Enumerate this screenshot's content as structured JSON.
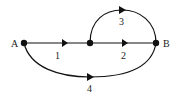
{
  "diagram": {
    "type": "directed-graph",
    "nodes": [
      {
        "id": "A",
        "label": "A",
        "x": 24,
        "y": 43
      },
      {
        "id": "M",
        "label": "",
        "x": 90,
        "y": 43
      },
      {
        "id": "B",
        "label": "B",
        "x": 156,
        "y": 43
      }
    ],
    "edges": [
      {
        "id": "1",
        "label": "1",
        "from": "A",
        "to": "M",
        "shape": "straight"
      },
      {
        "id": "2",
        "label": "2",
        "from": "M",
        "to": "B",
        "shape": "straight"
      },
      {
        "id": "3",
        "label": "3",
        "from": "M",
        "to": "B",
        "shape": "upper-arc"
      },
      {
        "id": "4",
        "label": "4",
        "from": "A",
        "to": "B",
        "shape": "lower-arc"
      }
    ],
    "colors": {
      "stroke": "#111111",
      "background": "#ffffff"
    }
  }
}
